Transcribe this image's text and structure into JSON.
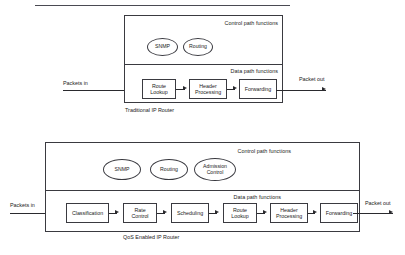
{
  "figure": {
    "top_rule": true
  },
  "diagrams": [
    {
      "id": "traditional-ip-router",
      "caption": "Traditional IP Router",
      "control_region_label": "Control path functions",
      "data_region_label": "Data path functions",
      "input_label": "Packets in",
      "output_label": "Packet out",
      "control_functions": [
        {
          "label": "SNMP"
        },
        {
          "label": "Routing"
        }
      ],
      "data_functions": [
        {
          "line1": "Route",
          "line2": "Lookup"
        },
        {
          "line1": "Header",
          "line2": "Processing"
        },
        {
          "line1": "Forwarding",
          "line2": ""
        }
      ]
    },
    {
      "id": "qos-enabled-ip-router",
      "caption": "QoS Enabled IP Router",
      "control_region_label": "Control path functions",
      "data_region_label": "Data path functions",
      "input_label": "Packets in",
      "output_label": "Packet out",
      "control_functions": [
        {
          "label": "SNMP"
        },
        {
          "label": "Routing"
        },
        {
          "line1": "Admission",
          "line2": "Control"
        }
      ],
      "data_functions": [
        {
          "line1": "Classification",
          "line2": ""
        },
        {
          "line1": "Rate",
          "line2": "Control"
        },
        {
          "line1": "Scheduling",
          "line2": ""
        },
        {
          "line1": "Route",
          "line2": "Lookup"
        },
        {
          "line1": "Header",
          "line2": "Processing"
        },
        {
          "line1": "Forwarding",
          "line2": ""
        }
      ]
    }
  ],
  "colors": {
    "stroke": "#3a3a40",
    "arrow": "#2a2a2e",
    "rule": "#4a4a52",
    "background": "#ffffff",
    "text": "#1a1a1a"
  }
}
